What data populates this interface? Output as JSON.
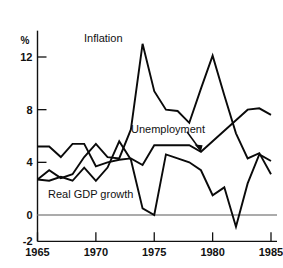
{
  "chart_data": {
    "type": "line",
    "title": "",
    "subtitle": "",
    "xlabel": "",
    "ylabel": "",
    "unit_label": "%",
    "xlim": [
      1965,
      1985
    ],
    "ylim": [
      -2,
      14
    ],
    "grid": false,
    "legend": "inline-annotations",
    "x_ticks": [
      "1965",
      "1970",
      "1975",
      "1980",
      "1985"
    ],
    "x_tick_values": [
      1965,
      1970,
      1975,
      1980,
      1985
    ],
    "y_ticks": [
      "12",
      "8",
      "4",
      "0",
      "-2"
    ],
    "y_tick_values": [
      12,
      8,
      4,
      0,
      -2
    ],
    "x": [
      1965,
      1966,
      1967,
      1968,
      1969,
      1970,
      1971,
      1972,
      1973,
      1974,
      1975,
      1976,
      1977,
      1978,
      1979,
      1980,
      1981,
      1982,
      1983,
      1984,
      1985
    ],
    "series": [
      {
        "name": "Inflation",
        "label": "Inflation",
        "values": [
          2.7,
          3.4,
          2.8,
          3.1,
          4.4,
          5.4,
          4.4,
          4.3,
          6.5,
          13.0,
          9.4,
          8.0,
          7.9,
          7.0,
          9.6,
          12.1,
          9.1,
          6.2,
          4.3,
          4.7,
          3.1
        ]
      },
      {
        "name": "Unemployment",
        "label": "Unemployment",
        "values": [
          5.2,
          5.2,
          4.4,
          5.4,
          5.4,
          3.7,
          4.0,
          4.2,
          4.3,
          3.8,
          5.3,
          5.3,
          5.3,
          5.3,
          4.8,
          5.6,
          6.4,
          7.2,
          8.0,
          8.1,
          7.6
        ]
      },
      {
        "name": "Real GDP growth",
        "label": "Real GDP growth",
        "values": [
          2.7,
          2.6,
          2.9,
          2.6,
          3.6,
          2.6,
          3.6,
          5.6,
          4.2,
          0.5,
          0.0,
          4.6,
          4.3,
          4.0,
          3.4,
          1.5,
          2.1,
          -0.9,
          2.4,
          4.6,
          4.1
        ]
      }
    ],
    "annotations": [
      {
        "name": "unemployment-pointer",
        "text": "",
        "points_to_x": 1979,
        "points_to_y": 4.8
      }
    ]
  }
}
